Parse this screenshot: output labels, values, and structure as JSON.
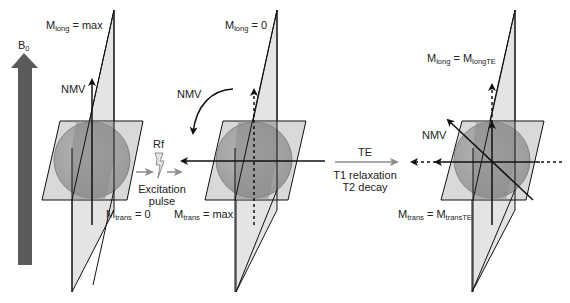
{
  "colors": {
    "b0_arrow": "#5a5a5a",
    "plane_fill": "#d9d9d9",
    "sphere_fill": "#a8a8a8",
    "sphere_dark": "#8a8a8a",
    "line": "#111111",
    "gray_arrow": "#8c8c8c"
  },
  "b0": {
    "symbol": "B",
    "subscript": "0"
  },
  "panels": [
    {
      "id": "initial",
      "top_label": {
        "main": "M",
        "sub": "long",
        "rest": " = max"
      },
      "nmv_label": "NMV",
      "bottom_label": {
        "main": "M",
        "sub": "trans",
        "rest": " = 0"
      }
    },
    {
      "id": "after-pulse",
      "top_label": {
        "main": "M",
        "sub": "long",
        "rest": " = 0"
      },
      "nmv_label": "NMV",
      "bottom_label": {
        "main": "M",
        "sub": "trans",
        "rest": " = max"
      }
    },
    {
      "id": "at-te",
      "top_label": {
        "main": "M",
        "sub": "long",
        "rest": " = M",
        "sub2": "longTE"
      },
      "nmv_label": "NMV",
      "bottom_label": {
        "main": "M",
        "sub": "trans",
        "rest": " = M",
        "sub2": "transTE"
      }
    }
  ],
  "rf": {
    "label": "Rf",
    "caption_line1": "Excitation",
    "caption_line2": "pulse"
  },
  "te": {
    "label": "TE",
    "caption_line1": "T1 relaxation",
    "caption_line2": "T2 decay"
  }
}
